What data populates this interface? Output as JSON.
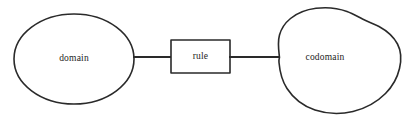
{
  "diagram": {
    "background_color": "#ffffff",
    "stroke_color": "#2a2a2a",
    "text_color": "#1c1c1c",
    "nodes": [
      {
        "id": "domain",
        "label": "domain",
        "shape": "ellipse",
        "cx": 74,
        "cy": 59,
        "rx": 60,
        "ry": 45
      },
      {
        "id": "rule",
        "label": "rule",
        "shape": "rectangle",
        "x": 171,
        "y": 40,
        "width": 59,
        "height": 33
      },
      {
        "id": "codomain",
        "label": "codomain",
        "shape": "blob",
        "cx": 338,
        "cy": 62,
        "label_x": 325,
        "label_y": 58
      }
    ],
    "connectors": [
      {
        "id": "domain-to-rule",
        "from": "domain",
        "to": "rule",
        "x1": 133,
        "x2": 171,
        "y": 57
      },
      {
        "id": "rule-to-codomain",
        "from": "rule",
        "to": "codomain",
        "x1": 230,
        "x2": 279,
        "y": 57
      }
    ]
  }
}
